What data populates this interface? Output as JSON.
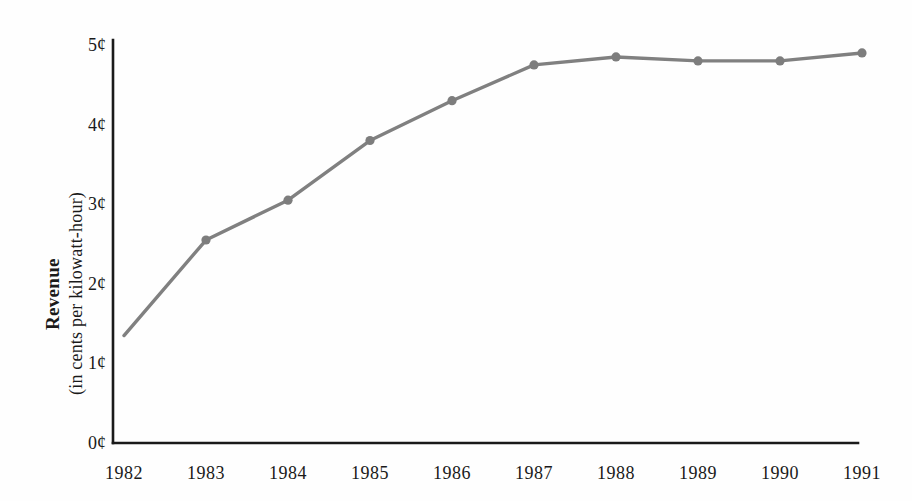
{
  "chart_data": {
    "type": "line",
    "title": "",
    "xlabel": "",
    "ylabel": "Revenue (in cents per kilowatt-hour)",
    "ylabel_lines": [
      "Revenue",
      "(in cents per kilowatt-hour)"
    ],
    "categories": [
      "1982",
      "1983",
      "1984",
      "1985",
      "1986",
      "1987",
      "1988",
      "1989",
      "1990",
      "1991"
    ],
    "x": [
      1982,
      1983,
      1984,
      1985,
      1986,
      1987,
      1988,
      1989,
      1990,
      1991
    ],
    "values": [
      1.35,
      2.55,
      3.05,
      3.8,
      4.3,
      4.75,
      4.85,
      4.8,
      4.8,
      4.9
    ],
    "series": [
      {
        "name": "Revenue",
        "values": [
          1.35,
          2.55,
          3.05,
          3.8,
          4.3,
          4.75,
          4.85,
          4.8,
          4.8,
          4.9
        ]
      }
    ],
    "ylim": [
      0,
      5
    ],
    "xlim": [
      1982,
      1991
    ],
    "y_ticks": [
      0,
      1,
      2,
      3,
      4,
      5
    ],
    "y_tick_labels": [
      "0¢",
      "1¢",
      "2¢",
      "3¢",
      "4¢",
      "5¢"
    ],
    "x_tick_labels": [
      "1982",
      "1983",
      "1984",
      "1985",
      "1986",
      "1987",
      "1988",
      "1989",
      "1990",
      "1991"
    ],
    "grid": false,
    "legend": false,
    "legend_position": "none",
    "marker": "circle",
    "line_color": "#808080",
    "marker_color": "#7d7d7d",
    "axis_color": "#1a1a1a",
    "background_color": "#fefefe",
    "text_color": "#1a1a1a"
  },
  "layout": {
    "plot_left": 113,
    "plot_right": 862,
    "plot_top": 45,
    "plot_bottom": 443,
    "axis_top": 40,
    "axis_right_end": 858,
    "x_positions": [
      124,
      206,
      288,
      370,
      452,
      534,
      616,
      698,
      780,
      862
    ],
    "y_positions": [
      443,
      363.4,
      283.8,
      204.2,
      124.6,
      45
    ]
  }
}
